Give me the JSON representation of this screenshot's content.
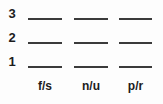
{
  "worksheet": {
    "rows": [
      {
        "label": "3"
      },
      {
        "label": "2"
      },
      {
        "label": "1"
      }
    ],
    "columns": [
      {
        "header": "f/s"
      },
      {
        "header": "n/u"
      },
      {
        "header": "p/r"
      }
    ],
    "blank_value": "",
    "colors": {
      "text": "#1c1c1c",
      "rule": "#3b3b3b",
      "background": "#fdfdfd"
    }
  }
}
